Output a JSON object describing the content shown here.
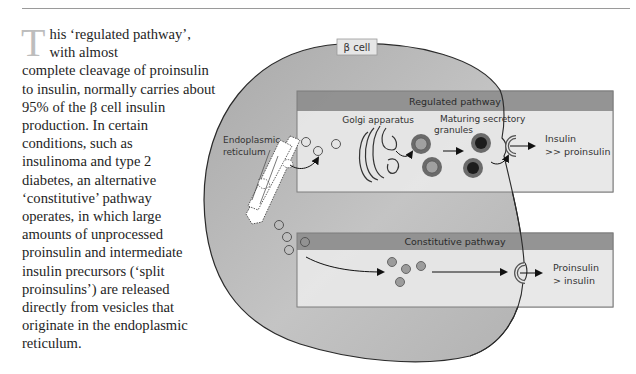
{
  "page": {
    "body_text": {
      "drop_cap": "T",
      "lines": [
        "his ‘regulated pathway’, with almost",
        "complete cleavage of proinsulin",
        "to insulin, normally carries about",
        "95% of the β cell insulin",
        "production. In certain",
        "conditions, such as",
        "insulinoma and type 2",
        "diabetes, an alternative",
        "‘constitutive’ pathway",
        "operates, in which large",
        "amounts of unprocessed",
        "proinsulin and intermediate",
        "insulin precursors (‘split",
        "proinsulins’) are released",
        "directly from vesicles that",
        "originate in the endoplasmic",
        "reticulum."
      ]
    }
  },
  "diagram": {
    "cell_label": "β cell",
    "er_label_line1": "Endoplasmic",
    "er_label_line2": "reticulum",
    "regulated": {
      "title": "Regulated pathway",
      "golgi_label": "Golgi apparatus",
      "granules_label_line1": "Maturing secretory",
      "granules_label_line2": "granules",
      "output_line1": "Insulin",
      "output_line2": ">> proinsulin"
    },
    "constitutive": {
      "title": "Constitutive pathway",
      "output_line1": "Proinsulin",
      "output_line2": "> insulin"
    },
    "colors": {
      "cell_fill": "#b4b4b4",
      "panel_header": "#8f8f8f",
      "panel_body": "#e6e6e6",
      "drop_cap": "#bdbdbd"
    }
  }
}
